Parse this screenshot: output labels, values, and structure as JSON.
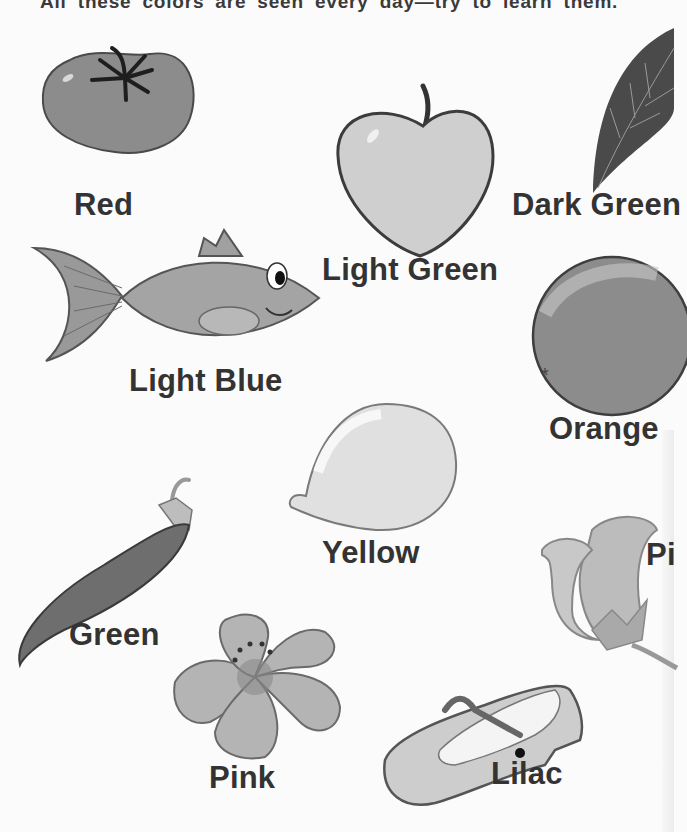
{
  "header": {
    "text": "All these colors are seen every day—try to learn them."
  },
  "items": [
    {
      "object": "tomato",
      "label": "Red"
    },
    {
      "object": "apple",
      "label": "Light Green"
    },
    {
      "object": "leaf",
      "label": "Dark Green"
    },
    {
      "object": "fish",
      "label": "Light Blue"
    },
    {
      "object": "orange",
      "label": "Orange"
    },
    {
      "object": "lemon",
      "label": "Yellow"
    },
    {
      "object": "pea-pod",
      "label": "Green"
    },
    {
      "object": "rose",
      "label": "Pi"
    },
    {
      "object": "flower",
      "label": "Pink"
    },
    {
      "object": "shoe",
      "label": "Lilac"
    }
  ],
  "colors": {
    "background": "#fbfbfb",
    "text": "#333333",
    "outline": "#555555"
  }
}
